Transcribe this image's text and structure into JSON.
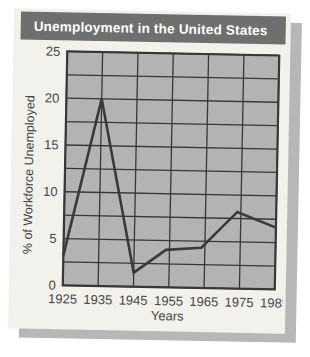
{
  "figure": {
    "card_bg": "#f2f1ec",
    "shadow_color": "#b7b7b7",
    "title_bar_bg": "#6f6f6f",
    "title_text_color": "#ffffff"
  },
  "chart_data": {
    "type": "line",
    "title": "Unemployment in the United States",
    "xlabel": "Years",
    "ylabel": "% of Workforce Unemployed",
    "xlim": [
      1925,
      1985
    ],
    "ylim": [
      0,
      25
    ],
    "x_ticks": [
      1925,
      1935,
      1945,
      1955,
      1965,
      1975,
      1985
    ],
    "y_ticks": [
      0,
      5,
      10,
      15,
      20,
      25
    ],
    "x_gridline_years": [
      1925,
      1935,
      1945,
      1955,
      1965,
      1975,
      1985
    ],
    "y_gridline_values": [
      0,
      2.5,
      5,
      7.5,
      10,
      12.5,
      15,
      17.5,
      20,
      22.5,
      25
    ],
    "grid": true,
    "legend": "none",
    "series": [
      {
        "name": "US unemployment rate",
        "points": [
          {
            "x": 1925,
            "y": 3.2
          },
          {
            "x": 1935,
            "y": 20
          },
          {
            "x": 1945,
            "y": 1.5
          },
          {
            "x": 1954,
            "y": 4.0
          },
          {
            "x": 1964,
            "y": 4.3
          },
          {
            "x": 1974,
            "y": 8.2
          },
          {
            "x": 1985,
            "y": 6.6
          }
        ]
      }
    ],
    "colors": {
      "plot_bg": "#b3b3b3",
      "grid": "#383838",
      "line": "#3a3a3a",
      "tick_text": "#464646"
    }
  }
}
